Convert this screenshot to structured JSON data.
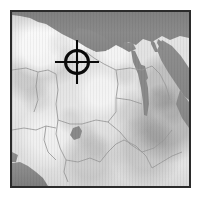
{
  "view": {
    "kind": "shaded-relief-locator-map",
    "region_label": "North Africa",
    "frame_border_color": "#2b2b2b",
    "page_background_color": "#ffffff"
  },
  "map": {
    "land_color": "#e4e4e4",
    "land_shadow_color": "#b9b9b9",
    "water_color": "#8c8c8c",
    "border_line_color": "#9a9a9a",
    "water_bodies": [
      {
        "name": "mediterranean-sea",
        "type": "sea"
      },
      {
        "name": "red-sea",
        "type": "sea"
      },
      {
        "name": "gulf-of-aqaba",
        "type": "gulf"
      },
      {
        "name": "nile-river",
        "type": "river"
      },
      {
        "name": "lake-nasser",
        "type": "lake"
      },
      {
        "name": "lake-chad",
        "type": "lake"
      },
      {
        "name": "gulf-of-guinea",
        "type": "gulf"
      }
    ],
    "country_boundaries_visible": true,
    "labels_visible": false,
    "graticule_visible": false
  },
  "marker": {
    "name": "crosshair-target",
    "shape": "circle-with-cross-and-center-dot",
    "color": "#0a0a0a",
    "center_x_px": 77,
    "center_y_px": 62,
    "ring_diameter_px": 26,
    "crosshair_span_px": 44,
    "stroke_px": 3
  }
}
